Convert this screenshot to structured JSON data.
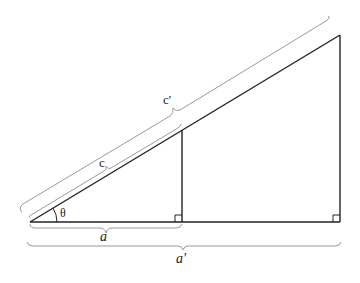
{
  "diagram": {
    "labels": {
      "hyp_small": "c",
      "hyp_large": "c'",
      "base_small": "a",
      "base_large": "a'",
      "angle": "θ"
    },
    "colors": {
      "line": "#222222",
      "brace": "#9a9a9a"
    }
  }
}
